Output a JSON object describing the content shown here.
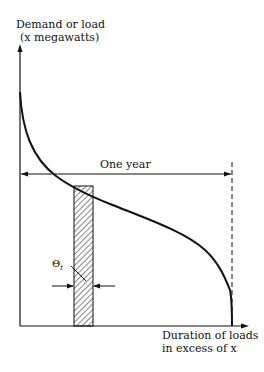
{
  "diagram": {
    "type": "load-duration-curve",
    "y_axis_label_line1": "Demand or load",
    "y_axis_label_line2": "(x megawatts)",
    "x_axis_label_line1": "Duration of loads",
    "x_axis_label_line2": "in excess of x",
    "span_label": "One year",
    "interval_label": "Θ",
    "interval_subscript": "t",
    "colors": {
      "ink": "#111111",
      "background": "#ffffff"
    }
  }
}
